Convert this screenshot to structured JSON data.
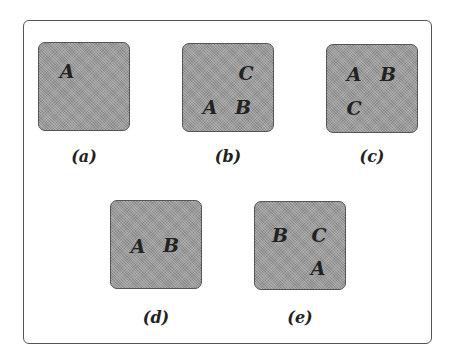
{
  "figure": {
    "panels": [
      {
        "id": "a",
        "caption": "(a)",
        "letters": [
          {
            "text": "A",
            "pos": "top-left"
          }
        ]
      },
      {
        "id": "b",
        "caption": "(b)",
        "letters": [
          {
            "text": "C",
            "pos": "top-right"
          },
          {
            "text": "A",
            "pos": "bottom-left"
          },
          {
            "text": "B",
            "pos": "bottom-right"
          }
        ]
      },
      {
        "id": "c",
        "caption": "(c)",
        "letters": [
          {
            "text": "A",
            "pos": "top-left"
          },
          {
            "text": "B",
            "pos": "top-right"
          },
          {
            "text": "C",
            "pos": "bottom-left"
          }
        ]
      },
      {
        "id": "d",
        "caption": "(d)",
        "letters": [
          {
            "text": "A",
            "pos": "middle-left"
          },
          {
            "text": "B",
            "pos": "middle-right"
          }
        ]
      },
      {
        "id": "e",
        "caption": "(e)",
        "letters": [
          {
            "text": "B",
            "pos": "top-left"
          },
          {
            "text": "C",
            "pos": "top-right"
          },
          {
            "text": "A",
            "pos": "bottom-right"
          }
        ]
      }
    ],
    "colors": {
      "panel_fill": "#9a9a9a",
      "border": "#555555",
      "text": "#222222"
    }
  }
}
